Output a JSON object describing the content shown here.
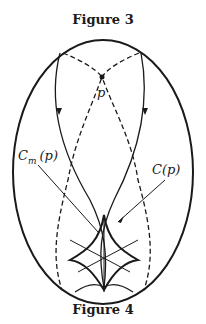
{
  "captions": {
    "top": "Figure 3",
    "bottom": "Figure 4"
  },
  "labels": {
    "point": "p",
    "cm": "C",
    "cm_sub": "m",
    "cm_arg": "(p)",
    "c": "C(p)"
  },
  "colors": {
    "ink": "#1a1a1a",
    "background": "#ffffff"
  }
}
